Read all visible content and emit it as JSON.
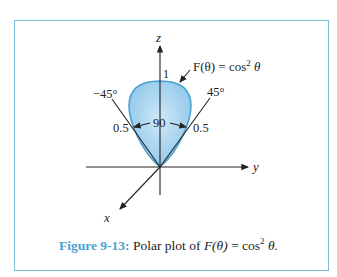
{
  "figure": {
    "number_label": "Figure 9-13:",
    "caption_text": "Polar plot of",
    "caption_math_lhs": "F(θ)",
    "caption_math_eq": " = cos",
    "caption_math_sup": "2",
    "caption_math_tail": " θ."
  },
  "diagram": {
    "axes": {
      "z": "z",
      "y": "y",
      "x": "x"
    },
    "function_label": "F(θ) = cos",
    "function_sup": "2",
    "function_tail": " θ",
    "tick_top": "1",
    "angle_left": "−45°",
    "angle_right": "45°",
    "half_left": "0.5",
    "half_right": "0.5",
    "beamwidth": "90",
    "colors": {
      "lobe_fill": "#a9d3ee",
      "lobe_stroke": "#4aa3cf",
      "frame": "#7dbfd8",
      "caption_accent": "#4aa3cf"
    }
  }
}
